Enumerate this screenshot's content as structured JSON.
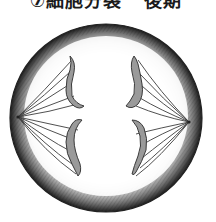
{
  "title": {
    "prefix": "⑦細胞分裂",
    "suffix": "後期"
  },
  "figure": {
    "cell": {
      "cx": 106,
      "cy": 118,
      "rx": 96,
      "ry": 94
    },
    "poles": [
      {
        "side": "left",
        "x": 18,
        "y": 117
      },
      {
        "side": "right",
        "x": 189,
        "y": 122
      }
    ],
    "chromosome_count": 4,
    "spindle_fiber_count_per_pole": 10,
    "colors": {
      "membrane_shading": "#2a2a2a",
      "chromosome_fill": "#9a9a9a",
      "chromosome_outline": "#3a3a3a",
      "fiber": "#3c3c3c",
      "background": "#ffffff"
    }
  }
}
